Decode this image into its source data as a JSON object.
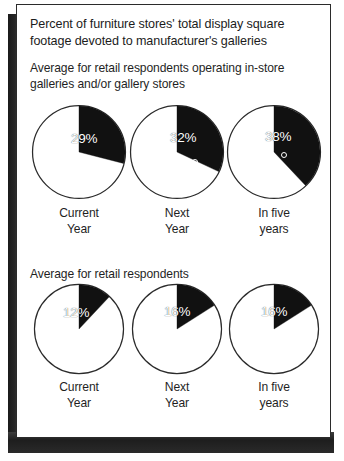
{
  "figure": {
    "title": "Percent of furniture stores' total display square footage devoted to manufacturer's galleries"
  },
  "groups": [
    {
      "subtitle": "Average for retail respondents operating in-store galleries and/or gallery stores",
      "items": [
        {
          "label_line1": "Current",
          "label_line2": "Year",
          "value": "29%"
        },
        {
          "label_line1": "Next",
          "label_line2": "Year",
          "value": "32%"
        },
        {
          "label_line1": "In five",
          "label_line2": "years",
          "value": "38%"
        }
      ]
    },
    {
      "subtitle": "Average for retail respondents",
      "items": [
        {
          "label_line1": "Current",
          "label_line2": "Year",
          "value": "12%"
        },
        {
          "label_line1": "Next",
          "label_line2": "Year",
          "value": "16%"
        },
        {
          "label_line1": "In five",
          "label_line2": "years",
          "value": "16%"
        }
      ]
    }
  ],
  "chart_data": [
    {
      "type": "pie",
      "title": "Percent of furniture stores' total display square footage devoted to manufacturer's galleries",
      "subtitle": "Average for retail respondents operating in-store galleries and/or gallery stores",
      "categories": [
        "Current Year",
        "Next Year",
        "In five years"
      ],
      "values": [
        29,
        32,
        38
      ],
      "unit": "%",
      "slice_color": "#111111",
      "remainder_color": "#ffffff",
      "legend": "none",
      "xlabel": "",
      "ylabel": ""
    },
    {
      "type": "pie",
      "title": "Percent of furniture stores' total display square footage devoted to manufacturer's galleries",
      "subtitle": "Average for retail respondents",
      "categories": [
        "Current Year",
        "Next Year",
        "In five years"
      ],
      "values": [
        12,
        16,
        16
      ],
      "unit": "%",
      "slice_color": "#111111",
      "remainder_color": "#ffffff",
      "legend": "none",
      "xlabel": "",
      "ylabel": ""
    }
  ]
}
